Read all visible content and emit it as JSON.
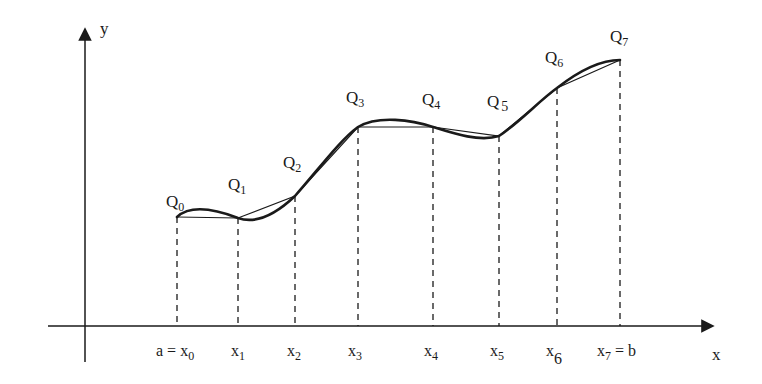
{
  "diagram": {
    "axes": {
      "x_label": "x",
      "y_label": "y"
    },
    "points": [
      {
        "label": "Q",
        "sub": "0",
        "x": 177,
        "y": 217
      },
      {
        "label": "Q",
        "sub": "1",
        "x": 238,
        "y": 218
      },
      {
        "label": "Q",
        "sub": "2",
        "x": 295,
        "y": 196
      },
      {
        "label": "Q",
        "sub": "3",
        "x": 358,
        "y": 127
      },
      {
        "label": "Q",
        "sub": "4",
        "x": 433,
        "y": 127
      },
      {
        "label": "Q",
        "sub": "5",
        "x": 499,
        "y": 136
      },
      {
        "label": "Q",
        "sub": "6",
        "x": 557,
        "y": 88
      },
      {
        "label": "Q",
        "sub": "7",
        "x": 620,
        "y": 60
      }
    ],
    "ticks": [
      {
        "prefix": "a = ",
        "label": "x",
        "sub": "0",
        "suffix": ""
      },
      {
        "prefix": "",
        "label": "x",
        "sub": "1",
        "suffix": ""
      },
      {
        "prefix": "",
        "label": "x",
        "sub": "2",
        "suffix": ""
      },
      {
        "prefix": "",
        "label": "x",
        "sub": "3",
        "suffix": ""
      },
      {
        "prefix": "",
        "label": "x",
        "sub": "4",
        "suffix": ""
      },
      {
        "prefix": "",
        "label": "x",
        "sub": "5",
        "suffix": ""
      },
      {
        "prefix": "",
        "label": "x",
        "sub": "6",
        "suffix": ""
      },
      {
        "prefix": "",
        "label": "x",
        "sub": "7",
        "suffix": " = b"
      }
    ],
    "colors": {
      "ink": "#1a1a1a",
      "background": "#ffffff"
    }
  }
}
